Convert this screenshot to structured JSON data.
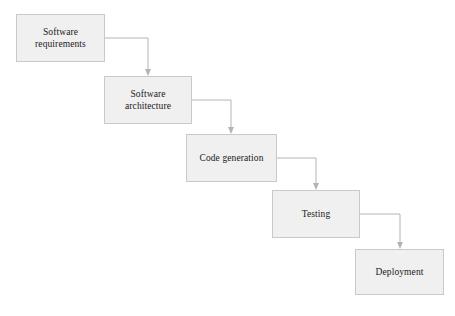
{
  "diagram": {
    "type": "waterfall-process-flow",
    "background_color": "#ffffff",
    "node_fill_color": "#f0f0f0",
    "node_border_color": "#c9c9c9",
    "connector_color": "#b4b4b4",
    "text_color": "#1a1a1a",
    "nodes": [
      {
        "id": "software-requirements",
        "label": "Software\nrequirements",
        "x": 16,
        "y": 14,
        "width": 89,
        "height": 48
      },
      {
        "id": "software-architecture",
        "label": "Software\narchitecture",
        "x": 104,
        "y": 76,
        "width": 88,
        "height": 48
      },
      {
        "id": "code-generation",
        "label": "Code generation",
        "x": 186,
        "y": 134,
        "width": 91,
        "height": 48
      },
      {
        "id": "testing",
        "label": "Testing",
        "x": 272,
        "y": 190,
        "width": 88,
        "height": 48
      },
      {
        "id": "deployment",
        "label": "Deployment",
        "x": 355,
        "y": 249,
        "width": 89,
        "height": 46
      }
    ],
    "connectors": [
      {
        "id": "requirements-to-architecture",
        "from": "software-requirements",
        "to": "software-architecture",
        "start_x": 105,
        "start_y": 38,
        "corner_x": 148,
        "end_y": 76
      },
      {
        "id": "architecture-to-code-generation",
        "from": "software-architecture",
        "to": "code-generation",
        "start_x": 192,
        "start_y": 100,
        "corner_x": 231,
        "end_y": 134
      },
      {
        "id": "code-generation-to-testing",
        "from": "code-generation",
        "to": "testing",
        "start_x": 277,
        "start_y": 158,
        "corner_x": 316,
        "end_y": 190
      },
      {
        "id": "testing-to-deployment",
        "from": "testing",
        "to": "deployment",
        "start_x": 360,
        "start_y": 214,
        "corner_x": 400,
        "end_y": 249
      }
    ]
  }
}
